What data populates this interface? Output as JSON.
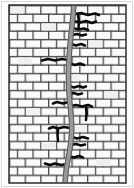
{
  "figure": {
    "width": 134,
    "height": 188
  },
  "colors": {
    "background": "#ffffff",
    "brick_fill": "#fbfbfb",
    "brick_fill_alt": "#f2f2f2",
    "mortar_line": "#4a4a4a",
    "outline": "#3a3a3a",
    "crack_band": "#9a9a9a",
    "crack_band_edge": "#4f4f4f",
    "crack_black": "#0b0b0b",
    "frame": "#cfcfcf"
  },
  "wall": {
    "x": 9,
    "y": 5,
    "width": 117,
    "height": 178,
    "rows": 21,
    "row_height": 8.48,
    "brick_width": 15.6,
    "bond": "running-bond",
    "mortar_thickness": 1.4
  },
  "main_crack": {
    "label": "main-vertical-crack",
    "stroke_width": 5.2,
    "path_points": [
      [
        74,
        3
      ],
      [
        73,
        16
      ],
      [
        71.5,
        30
      ],
      [
        70,
        45
      ],
      [
        69,
        60
      ],
      [
        68.5,
        74
      ],
      [
        68.8,
        88
      ],
      [
        69.6,
        100
      ],
      [
        70.8,
        112
      ],
      [
        71.6,
        124
      ],
      [
        71.4,
        136
      ],
      [
        70,
        148
      ],
      [
        68,
        160
      ],
      [
        66,
        172
      ],
      [
        64.8,
        186
      ]
    ]
  },
  "branch_cracks": [
    {
      "name": "branch-r-1",
      "d": "M75 14 L81 13 L88 15 L95 13.5 L99 15"
    },
    {
      "name": "branch-r-2",
      "d": "M74 21 L80 22.5 L86 21 L92 23 L96 21.5"
    },
    {
      "name": "branch-r-3",
      "d": "M73 28 L78 29.5 L84 28.5 L88 30"
    },
    {
      "name": "branch-r-4",
      "d": "M72.5 35 L77 34 L82 35.5 L86 34.5"
    },
    {
      "name": "branch-r-5",
      "d": "M71.5 44 L76 45.5 L81 44 L85 45.5"
    },
    {
      "name": "branch-l-1",
      "d": "M68 60 L62 59 L55 60.5 L48 59 L42 60.5"
    },
    {
      "name": "branch-r-6",
      "d": "M70 63.5 L75 65 L80 63.5 L84 65"
    },
    {
      "name": "branch-r-7",
      "d": "M69 86 L74 87.5 L79 86 L83 87.5 L86 86.5"
    },
    {
      "name": "branch-r-8",
      "d": "M69.5 94 L74 93 L78 94.5 L82 93.5"
    },
    {
      "name": "branch-l-2",
      "d": "M68.5 102 L63 103.5 L57 102 L53 103.5"
    },
    {
      "name": "branch-r-9",
      "d": "M70.5 106 L76 105 L82 106.5 L88 105 L92 106.5"
    },
    {
      "name": "branch-l-3",
      "d": "M70 128 L64 127 L58 128.5 L53 127 L49 128.5"
    },
    {
      "name": "branch-r-10",
      "d": "M72 137 L77 138.5 L83 137 L88 138.5"
    },
    {
      "name": "branch-r-11",
      "d": "M71 145 L76 144 L81 145.5 L85 144.5"
    },
    {
      "name": "branch-r-12",
      "d": "M69 156 L74 157.5 L79 156 L83 157.5"
    },
    {
      "name": "branch-l-4",
      "d": "M67 164 L61 165 L55 163.5 L50 165 L45 163.5"
    },
    {
      "name": "branch-vert-1",
      "d": "M78 15 L79 22 L78.5 28"
    },
    {
      "name": "branch-vert-2",
      "d": "M86 106 L86.5 113 L86 120"
    },
    {
      "name": "branch-vert-3",
      "d": "M58 128 L57.5 135 L58 141"
    }
  ],
  "accessibility": {
    "alt_text": "Drawing of a brick wall with a wide crack running vertically from top to bottom, with smaller cracks branching sideways along the mortar joints"
  }
}
